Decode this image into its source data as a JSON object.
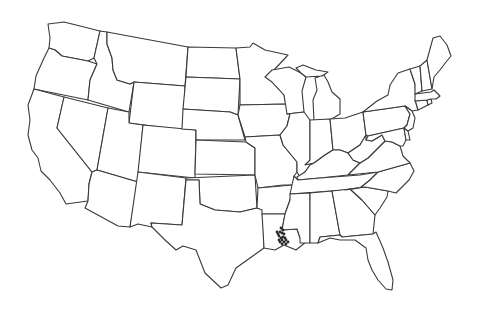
{
  "map": {
    "title": "",
    "type": "outline map of contiguous United States with occurrence points",
    "colors": {
      "background": "#ffffff",
      "border": "#3a3a3a",
      "points": "#2a2a2a"
    },
    "region_highlighted": "Louisiana",
    "points": [
      [
        281,
        228
      ],
      [
        283,
        230
      ],
      [
        280,
        232
      ],
      [
        282,
        233
      ],
      [
        278,
        234
      ],
      [
        284,
        234
      ],
      [
        279,
        236
      ],
      [
        283,
        237
      ],
      [
        281,
        238
      ],
      [
        285,
        238
      ],
      [
        279,
        240
      ],
      [
        282,
        240
      ],
      [
        286,
        240
      ],
      [
        280,
        242
      ],
      [
        284,
        242
      ],
      [
        288,
        242
      ],
      [
        282,
        244
      ],
      [
        286,
        244
      ],
      [
        277,
        232
      ]
    ]
  },
  "states": [
    {
      "name": "Washington",
      "d": "M48,24 L64,22 L100,31 L94,58 L88,61 L62,56 L55,50 L49,48 L50,38 Z"
    },
    {
      "name": "Oregon",
      "d": "M49,48 L55,50 L62,56 L88,61 L97,64 L90,80 L88,100 L34,89 L36,76 L44,58 Z"
    },
    {
      "name": "California",
      "d": "M34,89 L64,97 L57,128 L92,172 L89,184 L88,201 L66,204 L60,193 L50,180 L41,171 L38,158 L32,150 L28,135 L30,120 L28,105 Z"
    },
    {
      "name": "Idaho",
      "d": "M100,31 L107,32 L107,44 L112,58 L113,70 L117,80 L130,84 L134,82 L129,112 L88,100 L90,80 L97,64 L94,58 Z"
    },
    {
      "name": "Nevada",
      "d": "M64,97 L108,108 L97,170 L92,172 L57,128 Z"
    },
    {
      "name": "Montana",
      "d": "M107,32 L188,47 L185,86 L134,82 L130,84 L117,80 L113,70 L112,58 L107,44 Z"
    },
    {
      "name": "Wyoming",
      "d": "M134,82 L185,86 L183,130 L129,123 Z"
    },
    {
      "name": "Utah",
      "d": "M108,108 L129,112 L129,123 L143,125 L138,182 L97,170 Z"
    },
    {
      "name": "Arizona",
      "d": "M97,170 L138,182 L130,227 L118,226 L85,208 L88,201 L89,184 L92,172 Z"
    },
    {
      "name": "Colorado",
      "d": "M143,125 L196,130 L195,178 L138,172 Z"
    },
    {
      "name": "New Mexico",
      "d": "M138,172 L186,178 L182,225 L151,223 L152,227 L138,224 L130,227 Z"
    },
    {
      "name": "North Dakota",
      "d": "M188,47 L236,48 L240,79 L186,77 Z"
    },
    {
      "name": "South Dakota",
      "d": "M186,77 L240,79 L238,115 L230,112 L183,109 Z"
    },
    {
      "name": "Nebraska",
      "d": "M183,109 L230,112 L238,115 L245,140 L196,140 L196,130 L182,129 Z"
    },
    {
      "name": "Kansas",
      "d": "M196,140 L246,142 L255,148 L255,175 L195,174 Z"
    },
    {
      "name": "Oklahoma",
      "d": "M186,178 L255,175 L257,208 L240,212 L215,210 L200,204 L199,180 L186,180 Z"
    },
    {
      "name": "Texas",
      "d": "M186,180 L199,180 L200,204 L215,210 L240,212 L257,208 L263,209 L264,248 L250,258 L236,268 L228,285 L221,288 L205,273 L196,250 L183,246 L176,250 L165,240 L152,227 L151,223 L182,225 Z"
    },
    {
      "name": "Minnesota",
      "d": "M236,48 L250,47 L253,43 L265,50 L288,55 L274,70 L272,82 L284,95 L286,104 L240,105 L240,79 Z"
    },
    {
      "name": "Iowa",
      "d": "M240,105 L286,104 L290,114 L287,126 L280,135 L245,137 L238,115 Z"
    },
    {
      "name": "Missouri",
      "d": "M245,137 L280,135 L283,145 L297,162 L297,172 L294,176 L293,185 L283,185 L258,188 L255,175 L255,148 L246,142 Z"
    },
    {
      "name": "Arkansas",
      "d": "M258,188 L293,185 L290,200 L285,214 L262,214 L262,210 L257,208 Z"
    },
    {
      "name": "Louisiana",
      "d": "M262,214 L285,214 L282,230 L297,229 L300,238 L306,242 L296,250 L284,245 L275,250 L264,248 L263,230 Z"
    },
    {
      "name": "Wisconsin",
      "d": "M265,77 L272,70 L289,67 L301,73 L306,77 L302,91 L304,112 L287,114 L284,95 L272,82 Z"
    },
    {
      "name": "Illinois",
      "d": "M287,114 L304,112 L310,120 L310,165 L305,172 L300,177 L297,172 L297,162 L283,145 L280,135 L287,126 L290,114 Z"
    },
    {
      "name": "Michigan",
      "d": "M315,78 L324,75 L328,82 L332,92 L340,99 L340,114 L330,120 L314,121 L313,100 L317,90 Z M296,68 L303,65 L316,70 L328,72 L322,76 L306,77 L301,73 Z"
    },
    {
      "name": "Indiana",
      "d": "M310,120 L330,119 L333,150 L325,155 L314,163 L305,165 L310,160 Z"
    },
    {
      "name": "Ohio",
      "d": "M330,119 L345,118 L363,112 L366,135 L360,145 L348,153 L340,150 L333,150 Z"
    },
    {
      "name": "Kentucky",
      "d": "M305,172 L310,165 L314,163 L325,155 L333,150 L340,150 L348,153 L353,160 L360,163 L348,175 L320,178 L298,180 L297,177 Z"
    },
    {
      "name": "Tennessee",
      "d": "M294,176 L298,180 L320,178 L360,175 L378,172 L370,180 L360,188 L345,190 L290,194 Z"
    },
    {
      "name": "Mississippi",
      "d": "M290,194 L310,193 L310,243 L300,243 L300,238 L297,229 L282,230 L285,214 L290,200 Z"
    },
    {
      "name": "Alabama",
      "d": "M310,193 L332,191 L340,235 L320,237 L318,243 L310,243 Z"
    },
    {
      "name": "Georgia",
      "d": "M332,191 L350,189 L362,200 L375,215 L373,234 L342,237 L340,235 Z"
    },
    {
      "name": "Florida",
      "d": "M318,243 L320,237 L340,235 L342,237 L373,234 L376,232 L383,248 L388,262 L393,280 L392,290 L386,289 L378,280 L372,270 L368,260 L366,248 L355,240 L340,240 L330,238 Z"
    },
    {
      "name": "South Carolina",
      "d": "M350,189 L365,187 L388,191 L387,197 L380,208 L375,215 L362,200 Z"
    },
    {
      "name": "North Carolina",
      "d": "M378,172 L410,163 L414,171 L409,180 L396,193 L388,191 L365,187 L350,189 L345,190 L360,188 L370,180 Z"
    },
    {
      "name": "Virginia",
      "d": "M360,163 L368,158 L378,148 L385,141 L392,142 L400,146 L403,156 L410,163 L378,172 L348,175 Z"
    },
    {
      "name": "West Virginia",
      "d": "M348,153 L360,145 L366,135 L366,140 L372,141 L382,135 L385,141 L378,148 L368,158 L360,163 L353,160 Z"
    },
    {
      "name": "Pennsylvania",
      "d": "M363,112 L405,106 L410,114 L407,125 L404,128 L368,136 L366,135 Z"
    },
    {
      "name": "New York",
      "d": "M368,108 L377,101 L388,95 L390,85 L398,73 L410,69 L415,84 L416,103 L418,110 L412,111 L405,106 L363,112 Z"
    },
    {
      "name": "Maryland",
      "d": "M368,136 L404,128 L406,140 L403,146 L400,146 L392,142 L385,141 L382,135 L372,141 L366,140 Z"
    },
    {
      "name": "Delaware",
      "d": "M404,128 L408,131 L410,140 L406,140 Z"
    },
    {
      "name": "New Jersey",
      "d": "M405,106 L412,111 L415,118 L413,128 L408,131 L404,128 L407,125 L410,114 Z"
    },
    {
      "name": "Connecticut",
      "d": "M415,101 L427,100 L428,105 L418,110 L416,103 Z"
    },
    {
      "name": "Rhode Island",
      "d": "M427,100 L431,99 L432,103 L428,105 Z"
    },
    {
      "name": "Massachusetts",
      "d": "M415,94 L431,92 L434,90 L440,96 L436,99 L431,99 L427,100 L415,101 Z"
    },
    {
      "name": "Vermont",
      "d": "M410,69 L420,66 L422,91 L415,94 L415,84 Z"
    },
    {
      "name": "New Hampshire",
      "d": "M420,66 L427,60 L432,89 L422,91 Z"
    },
    {
      "name": "Maine",
      "d": "M427,60 L433,38 L440,36 L447,45 L451,56 L446,62 L440,70 L434,77 L432,89 Z"
    }
  ]
}
